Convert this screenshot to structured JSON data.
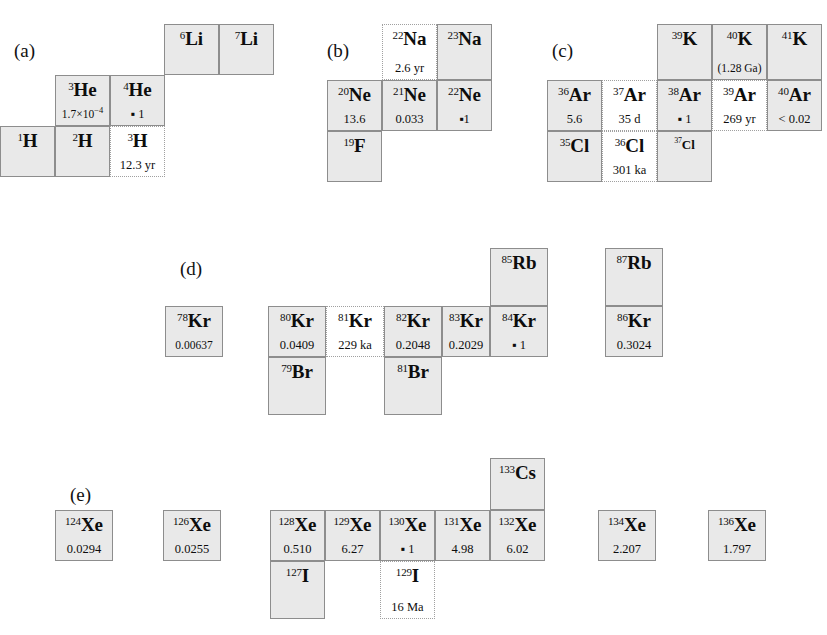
{
  "figure": {
    "colors": {
      "stable_fill": "#e9e9e9",
      "radioactive_fill": "#ffffff",
      "border_stable": "#8d8d8d",
      "border_radioactive": "#a0a0a0",
      "text": "#0d0d0d",
      "background": "#ffffff"
    }
  },
  "panels": [
    {
      "id": "a",
      "label": "(a)",
      "x": 14,
      "y": 40
    },
    {
      "id": "b",
      "label": "(b)",
      "x": 327,
      "y": 40
    },
    {
      "id": "c",
      "label": "(c)",
      "x": 552,
      "y": 40
    },
    {
      "id": "d",
      "label": "(d)",
      "x": 180,
      "y": 258
    },
    {
      "id": "e",
      "label": "(e)",
      "x": 70,
      "y": 484
    }
  ],
  "cells": [
    {
      "panel": "a",
      "mass": "6",
      "sym": "Li",
      "value": "",
      "stable": true,
      "x": 164,
      "y": 24,
      "w": 55,
      "h": 51,
      "small": false
    },
    {
      "panel": "a",
      "mass": "7",
      "sym": "Li",
      "value": "",
      "stable": true,
      "x": 219,
      "y": 24,
      "w": 55,
      "h": 51,
      "small": false
    },
    {
      "panel": "a",
      "mass": "3",
      "sym": "He",
      "value": "1.7×10⁻⁴",
      "stable": true,
      "x": 55,
      "y": 75,
      "w": 55,
      "h": 51,
      "small": false,
      "value_small": true
    },
    {
      "panel": "a",
      "mass": "4",
      "sym": "He",
      "value": "▪ 1",
      "stable": true,
      "x": 110,
      "y": 75,
      "w": 55,
      "h": 51,
      "small": false
    },
    {
      "panel": "a",
      "mass": "1",
      "sym": "H",
      "value": "",
      "stable": true,
      "x": 0,
      "y": 126,
      "w": 55,
      "h": 51,
      "small": false
    },
    {
      "panel": "a",
      "mass": "2",
      "sym": "H",
      "value": "",
      "stable": true,
      "x": 55,
      "y": 126,
      "w": 55,
      "h": 51,
      "small": false
    },
    {
      "panel": "a",
      "mass": "3",
      "sym": "H",
      "value": "12.3 yr",
      "stable": false,
      "x": 110,
      "y": 126,
      "w": 55,
      "h": 51,
      "small": false
    },
    {
      "panel": "b",
      "mass": "22",
      "sym": "Na",
      "value": "2.6 yr",
      "stable": false,
      "x": 382,
      "y": 24,
      "w": 55,
      "h": 56,
      "small": false
    },
    {
      "panel": "b",
      "mass": "23",
      "sym": "Na",
      "value": "",
      "stable": true,
      "x": 437,
      "y": 24,
      "w": 55,
      "h": 56,
      "small": false
    },
    {
      "panel": "b",
      "mass": "20",
      "sym": "Ne",
      "value": "13.6",
      "stable": true,
      "x": 327,
      "y": 80,
      "w": 55,
      "h": 51,
      "small": false
    },
    {
      "panel": "b",
      "mass": "21",
      "sym": "Ne",
      "value": "0.033",
      "stable": true,
      "x": 382,
      "y": 80,
      "w": 55,
      "h": 51,
      "small": false
    },
    {
      "panel": "b",
      "mass": "22",
      "sym": "Ne",
      "value": "▪1",
      "stable": true,
      "x": 437,
      "y": 80,
      "w": 55,
      "h": 51,
      "small": false
    },
    {
      "panel": "b",
      "mass": "19",
      "sym": "F",
      "value": "",
      "stable": true,
      "x": 327,
      "y": 131,
      "w": 55,
      "h": 51,
      "small": false
    },
    {
      "panel": "c",
      "mass": "39",
      "sym": "K",
      "value": "",
      "stable": true,
      "x": 657,
      "y": 24,
      "w": 55,
      "h": 56,
      "small": false
    },
    {
      "panel": "c",
      "mass": "40",
      "sym": "K",
      "value": "(1.28 Ga)",
      "stable": true,
      "x": 712,
      "y": 24,
      "w": 55,
      "h": 56,
      "small": false,
      "value_small": true
    },
    {
      "panel": "c",
      "mass": "41",
      "sym": "K",
      "value": "",
      "stable": true,
      "x": 767,
      "y": 24,
      "w": 55,
      "h": 56,
      "small": false
    },
    {
      "panel": "c",
      "mass": "36",
      "sym": "Ar",
      "value": "5.6",
      "stable": true,
      "x": 547,
      "y": 80,
      "w": 55,
      "h": 51,
      "small": false
    },
    {
      "panel": "c",
      "mass": "37",
      "sym": "Ar",
      "value": "35 d",
      "stable": false,
      "x": 602,
      "y": 80,
      "w": 55,
      "h": 51,
      "small": false
    },
    {
      "panel": "c",
      "mass": "38",
      "sym": "Ar",
      "value": "▪ 1",
      "stable": true,
      "x": 657,
      "y": 80,
      "w": 55,
      "h": 51,
      "small": false
    },
    {
      "panel": "c",
      "mass": "39",
      "sym": "Ar",
      "value": "269 yr",
      "stable": false,
      "x": 712,
      "y": 80,
      "w": 55,
      "h": 51,
      "small": false
    },
    {
      "panel": "c",
      "mass": "40",
      "sym": "Ar",
      "value": "< 0.02",
      "stable": true,
      "x": 767,
      "y": 80,
      "w": 55,
      "h": 51,
      "small": false
    },
    {
      "panel": "c",
      "mass": "35",
      "sym": "Cl",
      "value": "",
      "stable": true,
      "x": 547,
      "y": 131,
      "w": 55,
      "h": 51,
      "small": false
    },
    {
      "panel": "c",
      "mass": "36",
      "sym": "Cl",
      "value": "301 ka",
      "stable": false,
      "x": 602,
      "y": 131,
      "w": 55,
      "h": 51,
      "small": false
    },
    {
      "panel": "c",
      "mass": "37",
      "sym": "Cl",
      "value": "",
      "stable": true,
      "x": 657,
      "y": 131,
      "w": 55,
      "h": 51,
      "small": true
    },
    {
      "panel": "d",
      "mass": "85",
      "sym": "Rb",
      "value": "",
      "stable": true,
      "x": 490,
      "y": 248,
      "w": 58,
      "h": 58,
      "small": false
    },
    {
      "panel": "d",
      "mass": "87",
      "sym": "Rb",
      "value": "",
      "stable": true,
      "x": 605,
      "y": 248,
      "w": 58,
      "h": 58,
      "small": false
    },
    {
      "panel": "d",
      "mass": "78",
      "sym": "Kr",
      "value": "0.00637",
      "stable": true,
      "x": 165,
      "y": 306,
      "w": 58,
      "h": 51,
      "small": false,
      "value_small": true
    },
    {
      "panel": "d",
      "mass": "80",
      "sym": "Kr",
      "value": "0.0409",
      "stable": true,
      "x": 268,
      "y": 306,
      "w": 58,
      "h": 51,
      "small": false
    },
    {
      "panel": "d",
      "mass": "81",
      "sym": "Kr",
      "value": "229 ka",
      "stable": false,
      "x": 326,
      "y": 306,
      "w": 58,
      "h": 51,
      "small": false
    },
    {
      "panel": "d",
      "mass": "82",
      "sym": "Kr",
      "value": "0.2048",
      "stable": true,
      "x": 384,
      "y": 306,
      "w": 58,
      "h": 51,
      "small": false
    },
    {
      "panel": "d",
      "mass": "83",
      "sym": "Kr",
      "value": "0.2029",
      "stable": true,
      "x": 442,
      "y": 306,
      "w": 48,
      "h": 51,
      "small": false
    },
    {
      "panel": "d",
      "mass": "84",
      "sym": "Kr",
      "value": "▪ 1",
      "stable": true,
      "x": 490,
      "y": 306,
      "w": 58,
      "h": 51,
      "small": false
    },
    {
      "panel": "d",
      "mass": "86",
      "sym": "Kr",
      "value": "0.3024",
      "stable": true,
      "x": 605,
      "y": 306,
      "w": 58,
      "h": 51,
      "small": false
    },
    {
      "panel": "d",
      "mass": "79",
      "sym": "Br",
      "value": "",
      "stable": true,
      "x": 268,
      "y": 357,
      "w": 58,
      "h": 58,
      "small": false
    },
    {
      "panel": "d",
      "mass": "81",
      "sym": "Br",
      "value": "",
      "stable": true,
      "x": 384,
      "y": 357,
      "w": 58,
      "h": 58,
      "small": false
    },
    {
      "panel": "e",
      "mass": "133",
      "sym": "Cs",
      "value": "",
      "stable": true,
      "x": 490,
      "y": 458,
      "w": 55,
      "h": 52,
      "small": false
    },
    {
      "panel": "e",
      "mass": "124",
      "sym": "Xe",
      "value": "0.0294",
      "stable": true,
      "x": 55,
      "y": 510,
      "w": 58,
      "h": 51,
      "small": false
    },
    {
      "panel": "e",
      "mass": "126",
      "sym": "Xe",
      "value": "0.0255",
      "stable": true,
      "x": 163,
      "y": 510,
      "w": 58,
      "h": 51,
      "small": false
    },
    {
      "panel": "e",
      "mass": "128",
      "sym": "Xe",
      "value": "0.510",
      "stable": true,
      "x": 270,
      "y": 510,
      "w": 55,
      "h": 51,
      "small": false
    },
    {
      "panel": "e",
      "mass": "129",
      "sym": "Xe",
      "value": "6.27",
      "stable": true,
      "x": 325,
      "y": 510,
      "w": 55,
      "h": 51,
      "small": false
    },
    {
      "panel": "e",
      "mass": "130",
      "sym": "Xe",
      "value": "▪ 1",
      "stable": true,
      "x": 380,
      "y": 510,
      "w": 55,
      "h": 51,
      "small": false
    },
    {
      "panel": "e",
      "mass": "131",
      "sym": "Xe",
      "value": "4.98",
      "stable": true,
      "x": 435,
      "y": 510,
      "w": 55,
      "h": 51,
      "small": false
    },
    {
      "panel": "e",
      "mass": "132",
      "sym": "Xe",
      "value": "6.02",
      "stable": true,
      "x": 490,
      "y": 510,
      "w": 55,
      "h": 51,
      "small": false
    },
    {
      "panel": "e",
      "mass": "134",
      "sym": "Xe",
      "value": "2.207",
      "stable": true,
      "x": 598,
      "y": 510,
      "w": 58,
      "h": 51,
      "small": false
    },
    {
      "panel": "e",
      "mass": "136",
      "sym": "Xe",
      "value": "1.797",
      "stable": true,
      "x": 708,
      "y": 510,
      "w": 58,
      "h": 51,
      "small": false
    },
    {
      "panel": "e",
      "mass": "127",
      "sym": "I",
      "value": "",
      "stable": true,
      "x": 270,
      "y": 561,
      "w": 55,
      "h": 58,
      "small": false
    },
    {
      "panel": "e",
      "mass": "129",
      "sym": "I",
      "value": "16 Ma",
      "stable": false,
      "x": 380,
      "y": 561,
      "w": 55,
      "h": 58,
      "small": false
    }
  ]
}
